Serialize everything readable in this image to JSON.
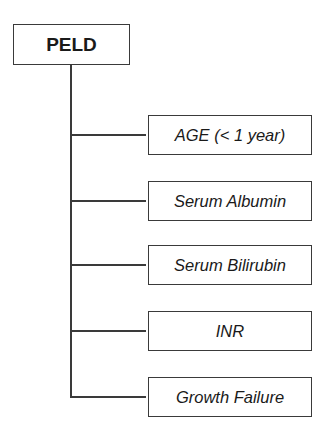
{
  "diagram": {
    "root": {
      "label": "PELD"
    },
    "children": [
      {
        "label": "AGE (< 1 year)"
      },
      {
        "label": "Serum Albumin"
      },
      {
        "label": "Serum Bilirubin"
      },
      {
        "label": "INR"
      },
      {
        "label": "Growth Failure"
      }
    ],
    "colors": {
      "line": "#3a3a3a",
      "text": "#1a1a1a",
      "background": "#ffffff"
    }
  }
}
